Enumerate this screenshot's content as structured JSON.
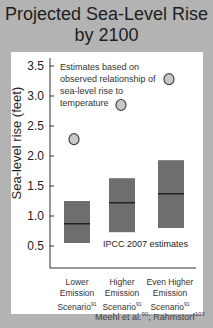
{
  "chart_data": {
    "type": "bar",
    "title": "Projected Sea-Level Rise by 2100",
    "xlabel": "",
    "ylabel": "Sea-level rise (feet)",
    "ylim": [
      0.2,
      3.6
    ],
    "yticks": [
      0.5,
      1.0,
      1.5,
      2.0,
      2.5,
      3.0,
      3.5
    ],
    "ytick_labels": [
      "0.5",
      "1.0",
      "1.5",
      "2.0",
      "2.5",
      "3.0",
      "3.5"
    ],
    "grid": false,
    "categories": [
      "Lower Emission Scenario",
      "Higher Emission Scenario",
      "Even Higher Emission Scenario"
    ],
    "category_superscripts": [
      "91",
      "91",
      "91"
    ],
    "series": [
      {
        "name": "IPCC 2007 estimates",
        "kind": "range-bar",
        "low": [
          0.55,
          0.73,
          0.8
        ],
        "high": [
          1.25,
          1.63,
          1.93
        ],
        "median": [
          0.87,
          1.22,
          1.37
        ],
        "color": "#6e6e6e"
      },
      {
        "name": "Estimates based on observed relationship of sea-level rise to temperature",
        "kind": "point",
        "values": [
          2.28,
          2.85,
          3.28
        ],
        "color": "#c8c8c8"
      }
    ],
    "annotations": [
      "Estimates based on observed relationship of sea-level rise to temperature",
      "IPCC 2007 estimates"
    ],
    "source": "Meehl et al.90; Rahmstorf103"
  },
  "title_line1": "Projected Sea-Level Rise",
  "title_line2": "by 2100",
  "ylabel": "Sea-level rise (feet)",
  "ticks": [
    "3.5",
    "3.0",
    "2.5",
    "2.0",
    "1.5",
    "1.0",
    "0.5"
  ],
  "annotation_observed": "Estimates based on observed relationship of sea-level rise to temperature",
  "annotation_ipcc": "IPCC 2007 estimates",
  "categories": [
    {
      "line1": "Lower",
      "line2": "Emission",
      "line3": "Scenario",
      "sup": "91"
    },
    {
      "line1": "Higher",
      "line2": "Emission",
      "line3": "Scenario",
      "sup": "91"
    },
    {
      "line1": "Even Higher",
      "line2": "Emission",
      "line3": "Scenario",
      "sup": "91"
    }
  ],
  "source": {
    "author1": "Meehl et al.",
    "sup1": "90",
    "sep": "; ",
    "author2": "Rahmstorf",
    "sup2": "103"
  },
  "colors": {
    "background": "#b3b3b3",
    "panel": "#ffffff",
    "bar": "#6e6e6e",
    "circle_fill": "#c8c8c8",
    "circle_stroke": "#444444"
  }
}
